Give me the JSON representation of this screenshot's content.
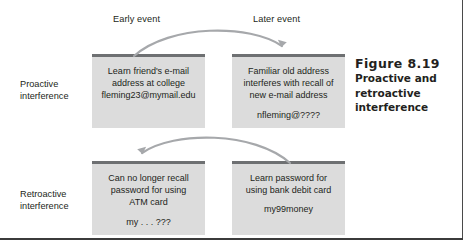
{
  "figure": {
    "number": "Figure 8.19",
    "caption_lines": [
      "Proactive and",
      "retroactive",
      "interference"
    ]
  },
  "headers": {
    "early": "Early event",
    "later": "Later event"
  },
  "rows": [
    {
      "label_line1": "Proactive",
      "label_line2": "interference"
    },
    {
      "label_line1": "Retroactive",
      "label_line2": "interference"
    }
  ],
  "boxes": {
    "top_left": {
      "lines": [
        "Learn friend's e-mail",
        "address at college",
        "fleming23@mymail.edu"
      ],
      "gap_before_index": null
    },
    "top_right": {
      "lines": [
        "Familiar old address",
        "interferes with recall of",
        "new e-mail address",
        "nfleming@????"
      ],
      "gap_before_index": 3
    },
    "bottom_left": {
      "lines": [
        "Can no longer recall",
        "password for using",
        "ATM card",
        "my . . . ???"
      ],
      "gap_before_index": 3
    },
    "bottom_right": {
      "lines": [
        "Learn password for",
        "using bank debit card",
        "my99money"
      ],
      "gap_before_index": 2
    }
  },
  "arrows": {
    "top": "curved-arrow-left-to-right",
    "bottom": "curved-arrow-right-to-left"
  },
  "colors": {
    "box_fill": "#dcdcdc",
    "box_top_bar": "#6e7072",
    "arrow": "#a6a8ab",
    "text": "#231f20"
  }
}
